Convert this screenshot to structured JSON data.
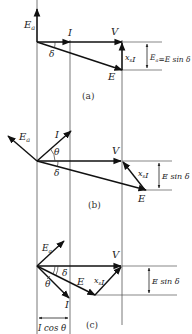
{
  "figure": {
    "colors": {
      "line": "#222222",
      "guide": "#555555",
      "background": "#ffffff"
    },
    "panels": [
      {
        "id": "a",
        "caption": "(a)",
        "labels": {
          "Ea": "Ea",
          "I": "I",
          "V": "V",
          "E": "E",
          "xsI": "xsI",
          "delta": "δ",
          "height": "Ea=E sin δ"
        }
      },
      {
        "id": "b",
        "caption": "(b)",
        "labels": {
          "Ea": "Ea",
          "I": "I",
          "V": "V",
          "E": "E",
          "xsI": "xsI",
          "theta": "θ",
          "delta": "δ",
          "height": "E sin δ"
        }
      },
      {
        "id": "c",
        "caption": "(c)",
        "labels": {
          "Ea": "Ea",
          "I": "I",
          "V": "V",
          "E": "E",
          "xsI": "xsI",
          "theta": "θ",
          "delta": "δ",
          "height": "E sin δ",
          "width": "I cos θ"
        }
      }
    ]
  }
}
